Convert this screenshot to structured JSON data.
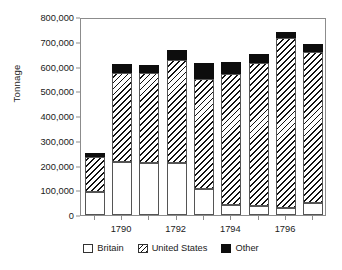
{
  "chart_data": {
    "type": "bar",
    "stacked": true,
    "title": "",
    "xlabel": "",
    "ylabel": "Tonnage",
    "ylim": [
      0,
      800000
    ],
    "ytick_step": 100000,
    "ytick_labels": [
      "0",
      "100,000",
      "200,000",
      "300,000",
      "400,000",
      "500,000",
      "600,000",
      "700,000",
      "800,000"
    ],
    "ytick_values": [
      0,
      100000,
      200000,
      300000,
      400000,
      500000,
      600000,
      700000,
      800000
    ],
    "grid": false,
    "legend_position": "bottom",
    "categories": [
      "1789",
      "1790",
      "1791",
      "1792",
      "1793",
      "1794",
      "1795",
      "1796",
      "1797"
    ],
    "xtick_labels_shown": [
      "",
      "1790",
      "",
      "1792",
      "",
      "1794",
      "",
      "1796",
      ""
    ],
    "series": [
      {
        "name": "Britain",
        "color": "#ffffff",
        "pattern": "solid-white",
        "values": [
          95000,
          215000,
          210000,
          210000,
          105000,
          40000,
          35000,
          30000,
          50000
        ]
      },
      {
        "name": "United States",
        "color": "#111111",
        "pattern": "diagonal-hatch",
        "values": [
          140000,
          360000,
          365000,
          415000,
          445000,
          530000,
          580000,
          685000,
          610000
        ]
      },
      {
        "name": "Other",
        "color": "#0d0d0d",
        "pattern": "solid-black",
        "values": [
          17000,
          35000,
          30000,
          40000,
          65000,
          50000,
          35000,
          25000,
          30000
        ]
      }
    ],
    "totals": [
      252000,
      610000,
      605000,
      665000,
      615000,
      620000,
      650000,
      740000,
      690000
    ]
  },
  "legend": {
    "items": [
      {
        "label": "Britain",
        "swatch": "white-square-icon"
      },
      {
        "label": "United States",
        "swatch": "hatched-square-icon"
      },
      {
        "label": "Other",
        "swatch": "black-square-icon"
      }
    ]
  }
}
